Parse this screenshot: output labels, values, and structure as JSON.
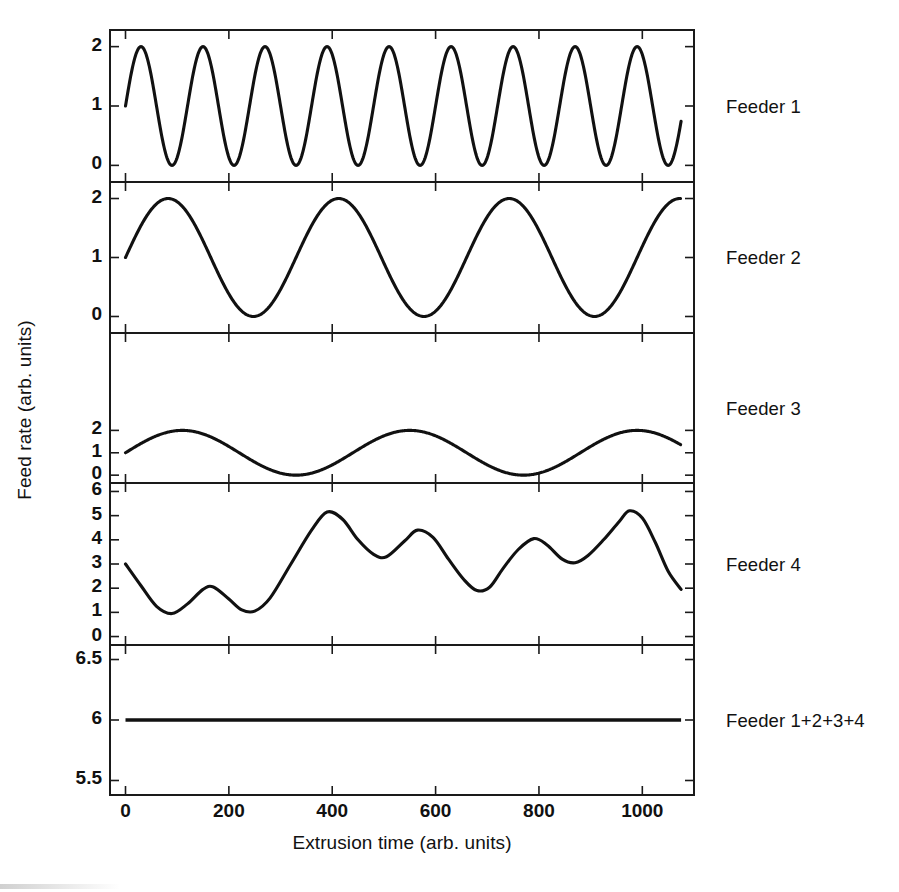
{
  "figure": {
    "background_color": "#ffffff",
    "line_color": "#111111",
    "axis_color": "#1a1a1a"
  },
  "axes": {
    "ylabel": "Feed rate (arb. units)",
    "xlabel": "Extrusion time (arb. units)",
    "xticks": [
      "0",
      "200",
      "400",
      "600",
      "800",
      "1000"
    ],
    "xtick_values": [
      0,
      200,
      400,
      600,
      800,
      1000
    ],
    "xlim": [
      -30,
      1100
    ]
  },
  "panels": [
    {
      "label": "Feeder 1",
      "yticks": [
        "0",
        "1",
        "2"
      ],
      "ytick_values": [
        0,
        1,
        2
      ],
      "ylim": [
        -0.28,
        2.28
      ]
    },
    {
      "label": "Feeder 2",
      "yticks": [
        "0",
        "1",
        "2"
      ],
      "ytick_values": [
        0,
        1,
        2
      ],
      "ylim": [
        -0.28,
        2.28
      ]
    },
    {
      "label": "Feeder 3",
      "yticks": [
        "0",
        "1",
        "2"
      ],
      "ytick_values": [
        0,
        1,
        2
      ],
      "ylim": [
        -0.28,
        2.28
      ]
    },
    {
      "label": "Feeder 4",
      "yticks": [
        "0",
        "1",
        "2",
        "3",
        "4",
        "5",
        "6"
      ],
      "ytick_values": [
        0,
        1,
        2,
        3,
        4,
        5,
        6
      ],
      "ylim": [
        -0.35,
        6.35
      ]
    },
    {
      "label": "Feeder 1+2+3+4",
      "yticks": [
        "5.5",
        "6",
        "6.5"
      ],
      "ytick_values": [
        5.5,
        6.0,
        6.5
      ],
      "ylim": [
        5.38,
        6.62
      ]
    }
  ],
  "chart_data": {
    "type": "line",
    "title": "",
    "xlabel": "Extrusion time (arb. units)",
    "ylabel": "Feed rate (arb. units)",
    "xlim": [
      -30,
      1100
    ],
    "grid": false,
    "legend": "right-side panel labels",
    "layout": "5 stacked subplots sharing one x axis",
    "subplots": [
      {
        "name": "Feeder 1",
        "description": "Sinusoid, 9 full cycles over the record, oscillating between 0 and 2, starting at 1 and rising.",
        "form": "1 + sin(2*pi*x/120)",
        "amplitude": 1.0,
        "offset": 1.0,
        "period": 120,
        "phase_deg": 0,
        "ymin": 0,
        "ymax": 2,
        "ylim": [
          -0.28,
          2.28
        ],
        "yticks": [
          0,
          1,
          2
        ],
        "x_start": 0,
        "x_end": 1075
      },
      {
        "name": "Feeder 2",
        "description": "Sinusoid, about 3.3 cycles, oscillating between 0 and 2, starting at 1 and rising.",
        "form": "1 + sin(2*pi*x/330)",
        "amplitude": 1.0,
        "offset": 1.0,
        "period": 330,
        "phase_deg": 0,
        "ymin": 0,
        "ymax": 2,
        "ylim": [
          -0.28,
          2.28
        ],
        "yticks": [
          0,
          1,
          2
        ],
        "x_start": 0,
        "x_end": 1075
      },
      {
        "name": "Feeder 3",
        "description": "Sinusoid, about 2.45 cycles, oscillating between 0 and 2, starting at 1 and rising.",
        "form": "1 + sin(2*pi*x/440)",
        "amplitude": 1.0,
        "offset": 1.0,
        "period": 440,
        "phase_deg": 0,
        "ymin": 0,
        "ymax": 2,
        "ylim": [
          -0.35,
          6.35
        ],
        "yticks": [
          0,
          1,
          2
        ],
        "x_start": 0,
        "x_end": 1075
      },
      {
        "name": "Feeder 4",
        "description": "Irregular wave, the sum of the three sinusoids plus a constant, ranging roughly 0.3 to 5.2 with local peaks near x=230, 310, 400, 480, 560, 640, 720, 850, 980.",
        "form": "3 + sin(2*pi*x/120) + sin(2*pi*x/330) + sin(2*pi*x/440) (visually approximated)",
        "ymin": 0.3,
        "ymax": 5.2,
        "ylim": [
          -0.35,
          6.35
        ],
        "yticks": [
          0,
          1,
          2,
          3,
          4,
          5,
          6
        ],
        "x_start": 0,
        "x_end": 1075,
        "approx_points": [
          [
            0,
            3.0
          ],
          [
            30,
            2.1
          ],
          [
            60,
            1.25
          ],
          [
            90,
            0.95
          ],
          [
            120,
            1.35
          ],
          [
            150,
            1.95
          ],
          [
            170,
            2.05
          ],
          [
            200,
            1.55
          ],
          [
            225,
            1.1
          ],
          [
            250,
            1.05
          ],
          [
            280,
            1.6
          ],
          [
            320,
            3.0
          ],
          [
            360,
            4.4
          ],
          [
            390,
            5.15
          ],
          [
            420,
            4.85
          ],
          [
            450,
            4.0
          ],
          [
            480,
            3.4
          ],
          [
            505,
            3.3
          ],
          [
            540,
            3.95
          ],
          [
            565,
            4.4
          ],
          [
            595,
            4.1
          ],
          [
            625,
            3.2
          ],
          [
            655,
            2.35
          ],
          [
            680,
            1.9
          ],
          [
            705,
            2.05
          ],
          [
            730,
            2.8
          ],
          [
            760,
            3.6
          ],
          [
            790,
            4.05
          ],
          [
            815,
            3.8
          ],
          [
            845,
            3.2
          ],
          [
            870,
            3.05
          ],
          [
            895,
            3.35
          ],
          [
            925,
            4.0
          ],
          [
            955,
            4.75
          ],
          [
            975,
            5.2
          ],
          [
            1000,
            4.9
          ],
          [
            1025,
            3.9
          ],
          [
            1050,
            2.7
          ],
          [
            1075,
            1.95
          ]
        ]
      },
      {
        "name": "Feeder 1+2+3+4",
        "description": "Constant horizontal line at 6 across the full record.",
        "constant_value": 6.0,
        "ylim": [
          5.38,
          6.62
        ],
        "yticks": [
          5.5,
          6.0,
          6.5
        ],
        "x_start": 0,
        "x_end": 1075
      }
    ]
  }
}
